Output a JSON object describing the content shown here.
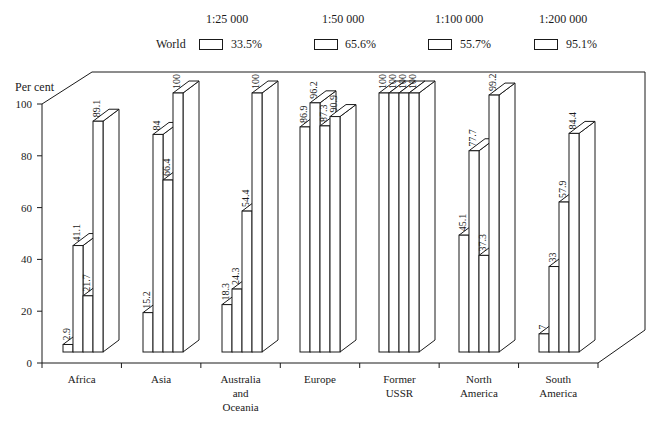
{
  "legend": {
    "row_label": "World",
    "items": [
      {
        "scale": "1:25 000",
        "world_value": "33.5%"
      },
      {
        "scale": "1:50 000",
        "world_value": "65.6%"
      },
      {
        "scale": "1:100 000",
        "world_value": "55.7%"
      },
      {
        "scale": "1:200 000",
        "world_value": "95.1%"
      }
    ]
  },
  "axis": {
    "ylabel": "Per cent",
    "yticks": [
      "0",
      "20",
      "40",
      "60",
      "80",
      "100"
    ]
  },
  "chart_data": {
    "type": "bar",
    "title": "",
    "xlabel": "",
    "ylabel": "Per cent",
    "ylim": [
      0,
      100
    ],
    "grid": false,
    "legend_position": "top",
    "categories": [
      "Africa",
      "Asia",
      "Australia and Oceania",
      "Europe",
      "Former USSR",
      "North America",
      "South America"
    ],
    "category_label_lines": [
      [
        "Africa"
      ],
      [
        "Asia"
      ],
      [
        "Australia",
        "and",
        "Oceania"
      ],
      [
        "Europe"
      ],
      [
        "Former",
        "USSR"
      ],
      [
        "North",
        "America"
      ],
      [
        "South",
        "America"
      ]
    ],
    "series": [
      {
        "name": "1:25 000",
        "world": "33.5%",
        "values": [
          2.9,
          15.2,
          18.3,
          86.9,
          100,
          45.1,
          7
        ]
      },
      {
        "name": "1:50 000",
        "world": "65.6%",
        "values": [
          41.1,
          84,
          24.3,
          96.2,
          100,
          77.7,
          33
        ]
      },
      {
        "name": "1:100 000",
        "world": "55.7%",
        "values": [
          21.7,
          66.4,
          54.4,
          87.3,
          100,
          37.3,
          57.9
        ]
      },
      {
        "name": "1:200 000",
        "world": "95.1%",
        "values": [
          89.1,
          100,
          100,
          90.9,
          100,
          99.2,
          84.4
        ]
      }
    ],
    "value_labels": [
      [
        "2.9",
        "41.1",
        "21.7",
        "89.1"
      ],
      [
        "15.2",
        "84",
        "66.4",
        "100"
      ],
      [
        "18.3",
        "24.3",
        "54.4",
        "100"
      ],
      [
        "86.9",
        "96.2",
        "87.3",
        "90.9"
      ],
      [
        "100",
        "100",
        "100",
        "100"
      ],
      [
        "45.1",
        "77.7",
        "37.3",
        "99.2"
      ],
      [
        "7",
        "33",
        "57.9",
        "84.4"
      ]
    ],
    "style": "3d-bar"
  }
}
